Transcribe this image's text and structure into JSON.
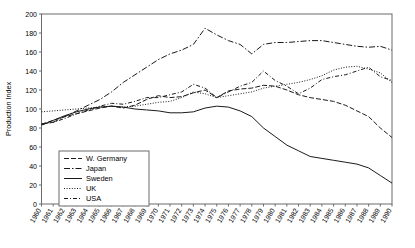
{
  "chart_data": {
    "type": "line",
    "title": "",
    "xlabel": "",
    "ylabel": "Production Index",
    "ylim": [
      0,
      200
    ],
    "ytick_step": 20,
    "yticks": [
      0,
      20,
      40,
      60,
      80,
      100,
      120,
      140,
      160,
      180,
      200
    ],
    "grid": false,
    "legend_position": "inside-lower-left",
    "x": [
      1960,
      1961,
      1962,
      1963,
      1964,
      1965,
      1966,
      1967,
      1968,
      1969,
      1970,
      1971,
      1972,
      1973,
      1974,
      1975,
      1976,
      1977,
      1978,
      1979,
      1980,
      1981,
      1982,
      1983,
      1984,
      1985,
      1986,
      1987,
      1988,
      1989,
      1990
    ],
    "categories": [
      "1960",
      "1961",
      "1962",
      "1963",
      "1964",
      "1965",
      "1966",
      "1967",
      "1968",
      "1969",
      "1970",
      "1971",
      "1972",
      "1973",
      "1974",
      "1975",
      "1976",
      "1977",
      "1978",
      "1979",
      "1980",
      "1981",
      "1982",
      "1983",
      "1984",
      "1985",
      "1986",
      "1987",
      "1988",
      "1989",
      "1990"
    ],
    "series": [
      {
        "name": "W. Germany",
        "dash": "5,2",
        "values": [
          84,
          88,
          92,
          95,
          98,
          101,
          103,
          101,
          104,
          110,
          114,
          112,
          113,
          117,
          120,
          112,
          119,
          121,
          122,
          125,
          124,
          120,
          115,
          112,
          110,
          108,
          104,
          98,
          92,
          80,
          70
        ]
      },
      {
        "name": "Japan",
        "dash": "6,2,1.5,2",
        "values": [
          84,
          86,
          92,
          98,
          104,
          110,
          118,
          128,
          136,
          144,
          152,
          158,
          162,
          168,
          185,
          178,
          172,
          168,
          158,
          168,
          170,
          170,
          171,
          172,
          172,
          170,
          168,
          166,
          165,
          166,
          162
        ]
      },
      {
        "name": "Sweden",
        "dash": "none",
        "values": [
          83,
          88,
          93,
          97,
          100,
          102,
          103,
          102,
          100,
          99,
          98,
          96,
          96,
          97,
          101,
          103,
          102,
          98,
          92,
          80,
          71,
          62,
          56,
          50,
          48,
          46,
          44,
          42,
          38,
          30,
          22
        ]
      },
      {
        "name": "UK",
        "dash": "1,1.6",
        "values": [
          97,
          98,
          99,
          100,
          101,
          102,
          103,
          102,
          103,
          105,
          107,
          108,
          112,
          118,
          116,
          112,
          114,
          116,
          118,
          122,
          124,
          126,
          128,
          131,
          135,
          141,
          144,
          145,
          142,
          138,
          128
        ]
      },
      {
        "name": "USA",
        "dash": "4,2,1,2",
        "values": [
          84,
          86,
          90,
          95,
          99,
          103,
          106,
          105,
          108,
          112,
          112,
          115,
          118,
          126,
          122,
          112,
          118,
          124,
          128,
          140,
          130,
          124,
          116,
          122,
          131,
          134,
          136,
          140,
          144,
          134,
          130
        ]
      }
    ]
  },
  "axes": {
    "ylabel": "Production Index"
  }
}
